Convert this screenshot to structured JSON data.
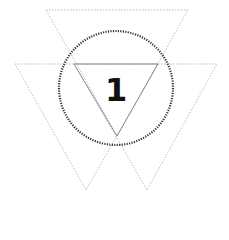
{
  "diagram": {
    "label": "1",
    "colors": {
      "dotted_triangle": "#aaaaaa",
      "solid_triangle": "#888888",
      "circle": "#333333",
      "label": "#111111"
    }
  }
}
